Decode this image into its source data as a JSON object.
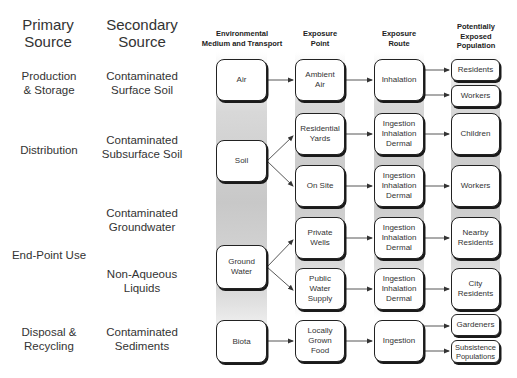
{
  "headers": {
    "primary_source": "Primary\nSource",
    "secondary_source": "Secondary\nSource",
    "environmental_medium": "Environmental\nMedium and Transport",
    "exposure_point": "Exposure\nPoint",
    "exposure_route": "Exposure\nRoute",
    "population": "Potentially\nExposed\nPopulation"
  },
  "primary_sources": [
    {
      "label": "Production\n& Storage"
    },
    {
      "label": "Distribution"
    },
    {
      "label": "End-Point Use"
    },
    {
      "label": "Disposal &\nRecycling"
    }
  ],
  "secondary_sources": [
    {
      "label": "Contaminated\nSurface Soil"
    },
    {
      "label": "Contaminated\nSubsurface Soil"
    },
    {
      "label": "Contaminated\nGroundwater"
    },
    {
      "label": "Non-Aqueous\nLiquids"
    },
    {
      "label": "Contaminated\nSediments"
    }
  ],
  "media": [
    {
      "label": "Air"
    },
    {
      "label": "Soil"
    },
    {
      "label": "Ground\nWater"
    },
    {
      "label": "Biota"
    }
  ],
  "exposure_points": [
    {
      "label": "Ambient\nAir"
    },
    {
      "label": "Residential\nYards"
    },
    {
      "label": "On Site"
    },
    {
      "label": "Private\nWells"
    },
    {
      "label": "Public Water\nSupply"
    },
    {
      "label": "Locally\nGrown Food"
    }
  ],
  "exposure_routes": [
    {
      "label": "Inhalation"
    },
    {
      "label": "Ingestion\nInhalation\nDermal"
    },
    {
      "label": "Ingestion\nInhalation\nDermal"
    },
    {
      "label": "Ingestion\nInhalation\nDermal"
    },
    {
      "label": "Ingestion\nInhalation\nDermal"
    },
    {
      "label": "Ingestion"
    }
  ],
  "populations": [
    {
      "label": "Residents"
    },
    {
      "label": "Workers"
    },
    {
      "label": "Children"
    },
    {
      "label": "Workers"
    },
    {
      "label": "Nearby\nResidents"
    },
    {
      "label": "City\nResidents"
    },
    {
      "label": "Gardeners"
    },
    {
      "label": "Subsistence\nPopulations"
    }
  ],
  "colors": {
    "band": "#c8c8c8",
    "box_border": "#222222",
    "text": "#333333"
  }
}
